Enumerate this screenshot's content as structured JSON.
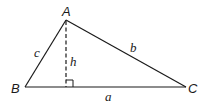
{
  "diagram": {
    "type": "triangle-with-altitude",
    "colors": {
      "stroke": "#1a1a1a",
      "background": "#ffffff"
    },
    "vertices": {
      "A": {
        "label": "A",
        "x": 66,
        "y": 20
      },
      "B": {
        "label": "B",
        "x": 25,
        "y": 87
      },
      "C": {
        "label": "C",
        "x": 186,
        "y": 87
      }
    },
    "sides": {
      "a": {
        "label": "a",
        "from": "B",
        "to": "C"
      },
      "b": {
        "label": "b",
        "from": "A",
        "to": "C"
      },
      "c": {
        "label": "c",
        "from": "A",
        "to": "B"
      }
    },
    "altitude": {
      "label": "h",
      "from": "A",
      "foot_x": 66,
      "foot_y": 87,
      "style": "dashed",
      "right_angle_marker": true
    }
  }
}
